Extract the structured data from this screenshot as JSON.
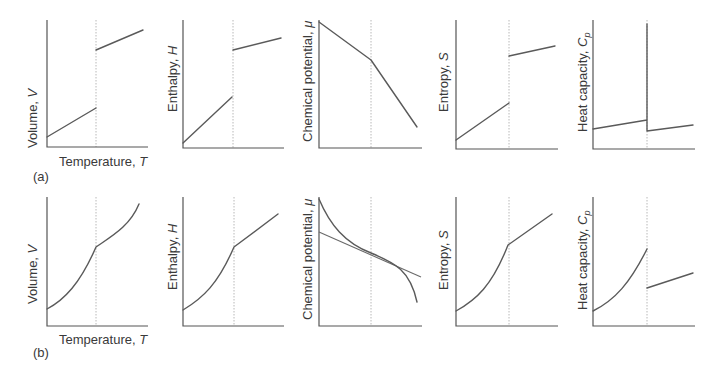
{
  "figure": {
    "rows": [
      {
        "label": "(a)",
        "description": "First-order phase transition",
        "panels": [
          {
            "ylabel": "Volume, ",
            "ysym": "V",
            "xlabel": "Temperature, ",
            "xsym": "T"
          },
          {
            "ylabel": "Enthalpy, ",
            "ysym": "H"
          },
          {
            "ylabel": "Chemical potential, ",
            "ysym": "μ"
          },
          {
            "ylabel": "Entropy, ",
            "ysym": "S"
          },
          {
            "ylabel": "Heat capacity, ",
            "ysym": "C",
            "ysub": "p"
          }
        ]
      },
      {
        "label": "(b)",
        "description": "Second-order phase transition",
        "panels": [
          {
            "ylabel": "Volume, ",
            "ysym": "V",
            "xlabel": "Temperature, ",
            "xsym": "T"
          },
          {
            "ylabel": "Enthalpy, ",
            "ysym": "H"
          },
          {
            "ylabel": "Chemical potential, ",
            "ysym": "μ"
          },
          {
            "ylabel": "Entropy, ",
            "ysym": "S"
          },
          {
            "ylabel": "Heat capacity, ",
            "ysym": "C",
            "ysub": "p"
          }
        ]
      }
    ],
    "colors": {
      "curve": "#5a5a5a",
      "axis": "#555555",
      "transition_marker": "#b8b8b8"
    }
  }
}
